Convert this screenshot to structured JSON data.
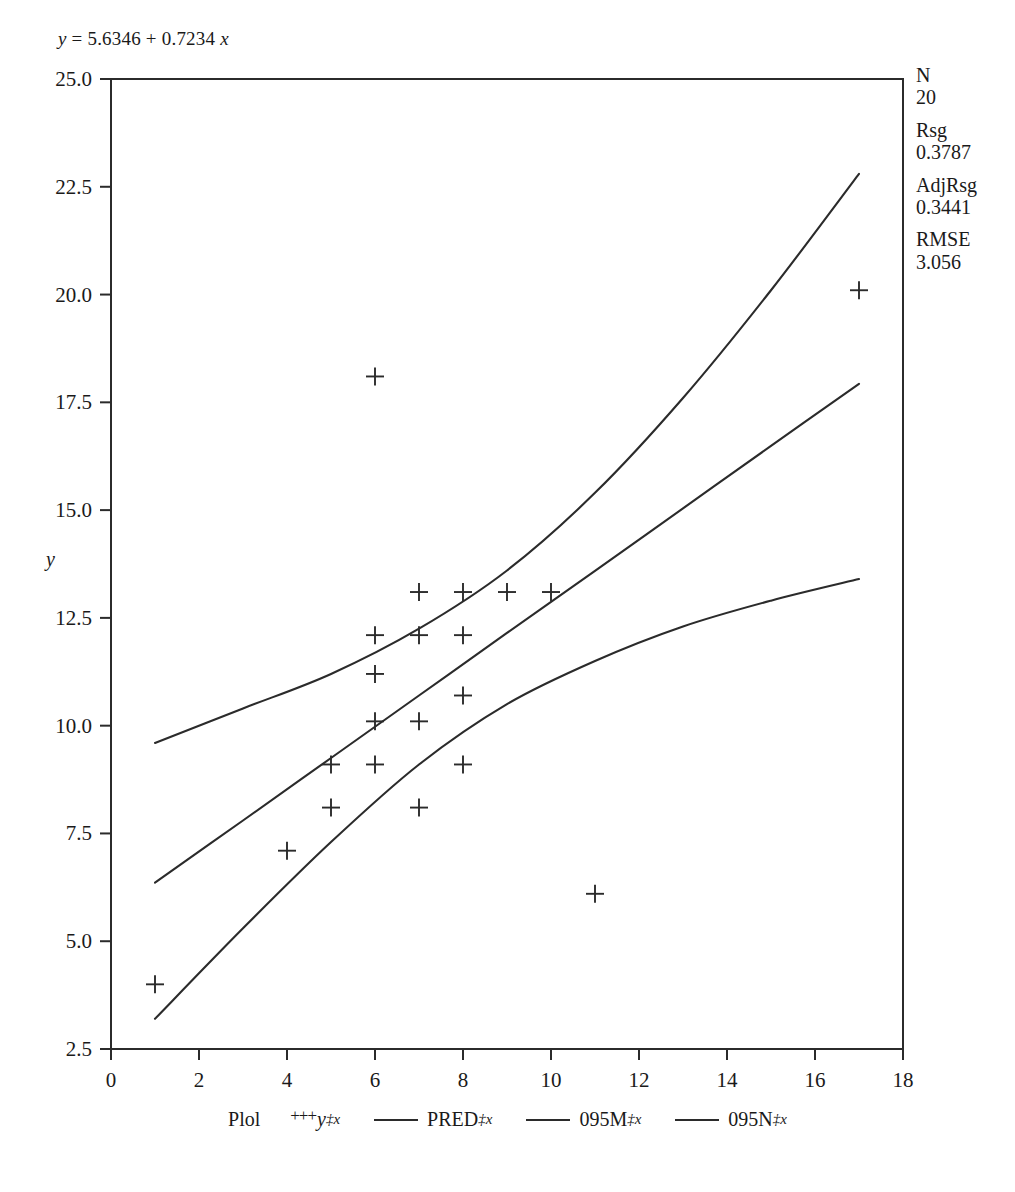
{
  "equation": {
    "lhs": "y",
    "eq": " = ",
    "rhs": "5.6346 + 0.7234 ",
    "var": "x",
    "full": "y = 5.6346 + 0.7234 x"
  },
  "stats": {
    "items": [
      {
        "key": "N",
        "value": "20"
      },
      {
        "key": "Rsg",
        "value": "0.3787"
      },
      {
        "key": "AdjRsg",
        "value": "0.3441"
      },
      {
        "key": "RMSE",
        "value": "3.056"
      }
    ]
  },
  "legend": {
    "lead": "Plol",
    "entries": [
      {
        "marker": "plus",
        "symbol": "+++",
        "label": "y",
        "sublabel": "‡x"
      },
      {
        "marker": "line",
        "symbol": "—",
        "label": "PRED",
        "sublabel": "‡x"
      },
      {
        "marker": "line",
        "symbol": "—",
        "label": "095M",
        "sublabel": "‡x"
      },
      {
        "marker": "line",
        "symbol": "—",
        "label": "095N",
        "sublabel": "‡x"
      }
    ]
  },
  "chart_data": {
    "type": "scatter",
    "title": "",
    "xlabel": "",
    "ylabel": "y",
    "xlim": [
      0,
      18
    ],
    "ylim": [
      2.5,
      25.0
    ],
    "xticks": [
      0,
      2,
      4,
      6,
      8,
      10,
      12,
      14,
      16,
      18
    ],
    "yticks": [
      2.5,
      5.0,
      7.5,
      10.0,
      12.5,
      15.0,
      17.5,
      20.0,
      22.5,
      25.0
    ],
    "xtick_labels": [
      "0",
      "2",
      "4",
      "6",
      "8",
      "10",
      "12",
      "14",
      "16",
      "18"
    ],
    "ytick_labels": [
      "2.5",
      "5.0",
      "7.5",
      "10.0",
      "12.5",
      "15.0",
      "17.5",
      "20.0",
      "22.5",
      "25.0"
    ],
    "grid": false,
    "legend_position": "bottom",
    "marker": "plus",
    "regression": {
      "intercept": 5.6346,
      "slope": 0.7234
    },
    "points": [
      {
        "x": 1,
        "y": 4.0
      },
      {
        "x": 4,
        "y": 7.1
      },
      {
        "x": 5,
        "y": 9.1
      },
      {
        "x": 5,
        "y": 8.1
      },
      {
        "x": 6,
        "y": 18.1
      },
      {
        "x": 6,
        "y": 12.1
      },
      {
        "x": 6,
        "y": 11.2
      },
      {
        "x": 6,
        "y": 10.1
      },
      {
        "x": 6,
        "y": 9.1
      },
      {
        "x": 7,
        "y": 13.1
      },
      {
        "x": 7,
        "y": 12.1
      },
      {
        "x": 7,
        "y": 10.1
      },
      {
        "x": 7,
        "y": 8.1
      },
      {
        "x": 8,
        "y": 13.1
      },
      {
        "x": 8,
        "y": 12.1
      },
      {
        "x": 8,
        "y": 10.7
      },
      {
        "x": 8,
        "y": 9.1
      },
      {
        "x": 9,
        "y": 13.1
      },
      {
        "x": 10,
        "y": 13.1
      },
      {
        "x": 11,
        "y": 6.1
      },
      {
        "x": 17,
        "y": 20.1
      }
    ],
    "series": [
      {
        "name": "PRED",
        "type": "line",
        "x": [
          1,
          3,
          5,
          7,
          9,
          11,
          13,
          15,
          17
        ],
        "y": [
          6.36,
          7.8,
          9.25,
          10.7,
          12.15,
          13.59,
          15.04,
          16.49,
          17.93
        ]
      },
      {
        "name": "095M",
        "type": "line",
        "x": [
          1,
          3,
          5,
          7,
          9,
          11,
          13,
          15,
          17
        ],
        "y": [
          9.6,
          10.4,
          11.2,
          12.25,
          13.6,
          15.4,
          17.6,
          20.1,
          22.8
        ]
      },
      {
        "name": "095N",
        "type": "line",
        "x": [
          1,
          3,
          5,
          7,
          9,
          11,
          13,
          15,
          17
        ],
        "y": [
          3.2,
          5.3,
          7.3,
          9.1,
          10.5,
          11.5,
          12.3,
          12.9,
          13.4
        ]
      }
    ]
  }
}
